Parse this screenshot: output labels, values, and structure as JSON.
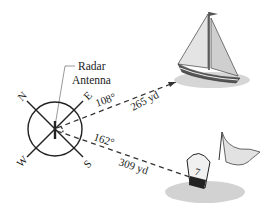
{
  "labels": {
    "radar_line1": "Radar",
    "radar_line2": "Antenna",
    "north": "N",
    "east": "E",
    "south": "S",
    "west": "W",
    "angle_boat": "108°",
    "angle_buoy": "162°",
    "distance_boat": "265 yd",
    "distance_buoy": "309 yd",
    "buoy_number": "7"
  },
  "icons": {
    "compass": "compass-icon",
    "sailboat": "sailboat-icon",
    "buoy": "buoy-icon"
  },
  "colors": {
    "line": "#222222",
    "sail_light": "#e6e6e6",
    "sail_dark": "#9a9a9a",
    "water": "#cfcfcf"
  }
}
